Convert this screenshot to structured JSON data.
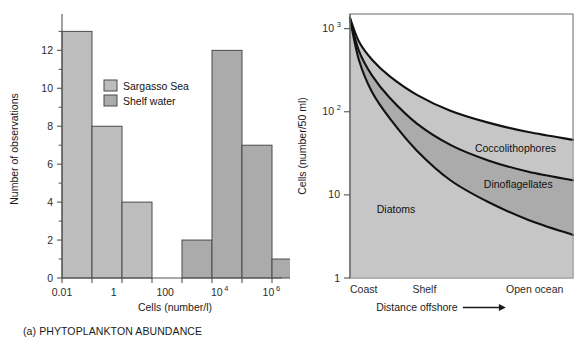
{
  "figure": {
    "panels": [
      {
        "id": "a",
        "caption": "(a) PHYTOPLANKTON ABUNDANCE"
      },
      {
        "id": "b",
        "caption": "(b) PHYTOPLANKTON COMPOSITION"
      }
    ]
  },
  "colors": {
    "sargasso_sea": "#bdbdbd",
    "shelf_water": "#ababab",
    "diatoms_band": "#c6c6c6",
    "dinoflagellates_band": "#ababab",
    "coccolithophores_band": "#c6c6c6",
    "curve_stroke": "#111111",
    "axis": "#555555"
  },
  "chart_data": [
    {
      "type": "bar",
      "title": "(a) PHYTOPLANKTON ABUNDANCE",
      "xlabel": "Cells (number/l)",
      "ylabel": "Number of observations",
      "ylim": [
        0,
        13.6
      ],
      "yticks": [
        0,
        2,
        4,
        6,
        8,
        10,
        12
      ],
      "yticklabels": [
        "0",
        "2",
        "4",
        "6",
        "8",
        "10",
        "12"
      ],
      "yminorticks": [
        1,
        3,
        5,
        7,
        9,
        11,
        13
      ],
      "grid": false,
      "xscale": "log",
      "xticklabels": [
        "0.01",
        "1",
        "100",
        "10",
        "10"
      ],
      "xticklabels_full": [
        "0.01",
        "1",
        "100",
        "10^4",
        "10^6"
      ],
      "xtick_exponents": [
        "",
        "",
        "",
        "4",
        "6"
      ],
      "xtick_bins": 7,
      "legend_position": "upper-center",
      "legend": [
        {
          "label": "Sargasso Sea",
          "color": "#bdbdbd"
        },
        {
          "label": "Shelf water",
          "color": "#ababab"
        }
      ],
      "bins": [
        {
          "index": 0,
          "value": 13,
          "series": "Sargasso Sea"
        },
        {
          "index": 1,
          "value": 8,
          "series": "Sargasso Sea"
        },
        {
          "index": 2,
          "value": 4,
          "series": "Sargasso Sea"
        },
        {
          "index": 3,
          "value": 0,
          "series": "Sargasso Sea"
        },
        {
          "index": 4,
          "value": 2,
          "series": "Shelf water"
        },
        {
          "index": 5,
          "value": 12,
          "series": "Shelf water"
        },
        {
          "index": 6,
          "value": 7,
          "series": "Shelf water"
        },
        {
          "index": 7,
          "value": 1,
          "series": "Shelf water"
        }
      ],
      "values": [
        13,
        8,
        4,
        0,
        2,
        12,
        7,
        1
      ]
    },
    {
      "type": "area",
      "title": "(b) PHYTOPLANKTON COMPOSITION",
      "xlabel": "Distance offshore",
      "xlabel_arrow": "⟶",
      "ylabel": "Cells (number/50 ml)",
      "yscale": "log",
      "ylim": [
        1,
        1500
      ],
      "yticks": [
        1,
        10,
        100,
        1000
      ],
      "yticklabels": [
        "1",
        "10",
        "10",
        "10"
      ],
      "ytick_exponents": [
        "",
        "",
        "2",
        "3"
      ],
      "grid": false,
      "xticklabels": [
        "Coast",
        "Shelf",
        "Open ocean"
      ],
      "xtick_fracs": [
        0.0,
        0.28,
        0.7
      ],
      "series": [
        {
          "name": "Diatoms",
          "label_x_frac": 0.12,
          "label_y_value": 6,
          "color": "#c6c6c6",
          "x": [
            0.0,
            0.04,
            0.1,
            0.18,
            0.3,
            0.45,
            0.62,
            0.8,
            1.0
          ],
          "y": [
            1300,
            420,
            170,
            82,
            34,
            15,
            8.2,
            5.0,
            3.3
          ]
        },
        {
          "name": "Dinoflagellates",
          "label_x_frac": 0.6,
          "label_y_value": 12,
          "color": "#ababab",
          "x": [
            0.0,
            0.04,
            0.1,
            0.18,
            0.3,
            0.45,
            0.62,
            0.8,
            1.0
          ],
          "y": [
            1320,
            540,
            270,
            145,
            72,
            40,
            26,
            19,
            15
          ]
        },
        {
          "name": "Coccolithophores",
          "label_x_frac": 0.56,
          "label_y_value": 33,
          "color": "#c6c6c6",
          "x": [
            0.0,
            0.04,
            0.1,
            0.18,
            0.3,
            0.45,
            0.62,
            0.8,
            1.0
          ],
          "y": [
            1350,
            700,
            420,
            265,
            160,
            103,
            74,
            57,
            46
          ]
        }
      ]
    }
  ]
}
